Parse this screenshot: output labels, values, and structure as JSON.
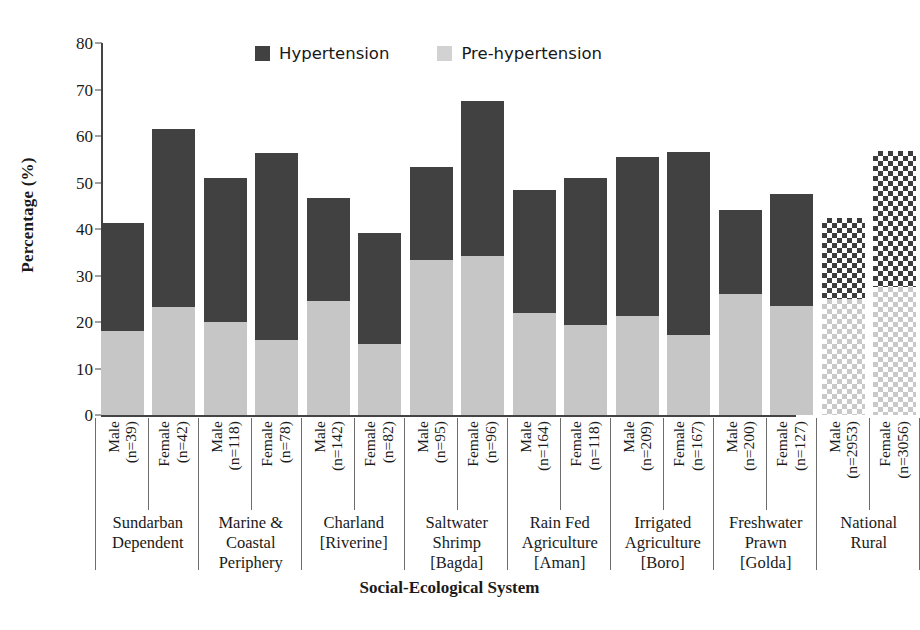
{
  "chart_data": {
    "type": "bar",
    "subtype": "stacked-bar",
    "title": "",
    "xlabel": "Social-Ecological System",
    "ylabel": "Percentage (%)",
    "ylim": [
      0,
      80
    ],
    "yticks": [
      0,
      10,
      20,
      30,
      40,
      50,
      60,
      70,
      80
    ],
    "grid": false,
    "legend_position": "top-center",
    "legend": [
      "Hypertension",
      "Pre-hypertension"
    ],
    "colors": {
      "hypertension": "#414141",
      "pre_hypertension": "#c6c6c6",
      "hypertension_national": "#3c3c3c",
      "pre_hypertension_national": "#c9c9c9",
      "axis": "#444444",
      "background": "#ffffff"
    },
    "categories": [
      "Sundarban Dependent / Male (n=39)",
      "Sundarban Dependent / Female (n=42)",
      "Marine & Coastal Periphery / Male (n=118)",
      "Marine & Coastal Periphery / Female (n=78)",
      "Charland [Riverine] / Male (n=142)",
      "Charland [Riverine] / Female (n=82)",
      "Saltwater Shrimp [Bagda] / Male (n=95)",
      "Saltwater Shrimp [Bagda] / Female (n=96)",
      "Rain Fed Agriculture [Aman] / Male (n=164)",
      "Rain Fed Agriculture [Aman] / Female (n=118)",
      "Irrigated Agriculture [Boro] / Male (n=209)",
      "Irrigated Agriculture [Boro] / Female (n=167)",
      "Freshwater Prawn [Golda] / Male (n=200)",
      "Freshwater Prawn [Golda] / Female (n=127)",
      "National Rural / Male (n=2953)",
      "National Rural / Female (n=3056)"
    ],
    "series": [
      {
        "name": "Pre-hypertension",
        "values": [
          18.0,
          23.3,
          20.0,
          16.2,
          24.5,
          15.3,
          33.3,
          34.2,
          22.0,
          19.3,
          21.3,
          17.2,
          26.0,
          23.5,
          25.0,
          27.5
        ]
      },
      {
        "name": "Hypertension",
        "values": [
          23.3,
          38.3,
          31.0,
          40.2,
          22.1,
          23.8,
          20.0,
          33.3,
          26.4,
          31.7,
          34.2,
          39.4,
          18.0,
          24.0,
          17.3,
          29.3
        ]
      }
    ],
    "totals": [
      41.3,
      61.6,
      51.0,
      56.4,
      46.6,
      39.1,
      53.3,
      67.5,
      48.4,
      51.0,
      55.5,
      56.6,
      44.0,
      47.5,
      42.3,
      56.8
    ]
  },
  "bars": [
    {
      "group": 0,
      "sex": "Male",
      "n": "(n=39)",
      "pre": 18.0,
      "total": 41.3,
      "pattern": "solid"
    },
    {
      "group": 0,
      "sex": "Female",
      "n": "(n=42)",
      "pre": 23.3,
      "total": 61.6,
      "pattern": "solid"
    },
    {
      "group": 1,
      "sex": "Male",
      "n": "(n=118)",
      "pre": 20.0,
      "total": 51.0,
      "pattern": "solid"
    },
    {
      "group": 1,
      "sex": "Female",
      "n": "(n=78)",
      "pre": 16.2,
      "total": 56.4,
      "pattern": "solid"
    },
    {
      "group": 2,
      "sex": "Male",
      "n": "(n=142)",
      "pre": 24.5,
      "total": 46.6,
      "pattern": "solid"
    },
    {
      "group": 2,
      "sex": "Female",
      "n": "(n=82)",
      "pre": 15.3,
      "total": 39.1,
      "pattern": "solid"
    },
    {
      "group": 3,
      "sex": "Male",
      "n": "(n=95)",
      "pre": 33.3,
      "total": 53.3,
      "pattern": "solid"
    },
    {
      "group": 3,
      "sex": "Female",
      "n": "(n=96)",
      "pre": 34.2,
      "total": 67.5,
      "pattern": "solid"
    },
    {
      "group": 4,
      "sex": "Male",
      "n": "(n=164)",
      "pre": 22.0,
      "total": 48.4,
      "pattern": "solid"
    },
    {
      "group": 4,
      "sex": "Female",
      "n": "(n=118)",
      "pre": 19.3,
      "total": 51.0,
      "pattern": "solid"
    },
    {
      "group": 5,
      "sex": "Male",
      "n": "(n=209)",
      "pre": 21.3,
      "total": 55.5,
      "pattern": "solid"
    },
    {
      "group": 5,
      "sex": "Female",
      "n": "(n=167)",
      "pre": 17.2,
      "total": 56.6,
      "pattern": "solid"
    },
    {
      "group": 6,
      "sex": "Male",
      "n": "(n=200)",
      "pre": 26.0,
      "total": 44.0,
      "pattern": "solid"
    },
    {
      "group": 6,
      "sex": "Female",
      "n": "(n=127)",
      "pre": 23.5,
      "total": 47.5,
      "pattern": "solid"
    },
    {
      "group": 7,
      "sex": "Male",
      "n": "(n=2953)",
      "pre": 25.0,
      "total": 42.3,
      "pattern": "checker"
    },
    {
      "group": 7,
      "sex": "Female",
      "n": "(n=3056)",
      "pre": 27.5,
      "total": 56.8,
      "pattern": "checker"
    }
  ],
  "groups": [
    {
      "lines": [
        "Sundarban",
        "Dependent"
      ]
    },
    {
      "lines": [
        "Marine &",
        "Coastal",
        "Periphery"
      ]
    },
    {
      "lines": [
        "Charland",
        "[Riverine]"
      ]
    },
    {
      "lines": [
        "Saltwater",
        "Shrimp",
        "[Bagda]"
      ]
    },
    {
      "lines": [
        "Rain Fed",
        "Agriculture",
        "[Aman]"
      ]
    },
    {
      "lines": [
        "Irrigated",
        "Agriculture",
        "[Boro]"
      ]
    },
    {
      "lines": [
        "Freshwater",
        "Prawn",
        "[Golda]"
      ]
    },
    {
      "lines": [
        "National",
        "Rural"
      ]
    }
  ],
  "axes": {
    "ylabel": "Percentage (%)",
    "xlabel": "Social-Ecological System",
    "yticks": [
      "0",
      "10",
      "20",
      "30",
      "40",
      "50",
      "60",
      "70",
      "80"
    ]
  },
  "legend": {
    "items": [
      {
        "label": "Hypertension",
        "swatch": "dark"
      },
      {
        "label": "Pre-hypertension",
        "swatch": "light"
      }
    ]
  }
}
